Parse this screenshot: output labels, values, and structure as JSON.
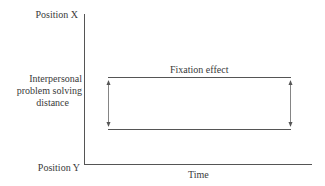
{
  "diagram": {
    "y_axis": {
      "top_label": "Position X",
      "bottom_label": "Position Y",
      "title_lines": [
        "Interpersonal",
        "problem solving",
        "distance"
      ]
    },
    "x_axis": {
      "label": "Time"
    },
    "band": {
      "label": "Fixation effect"
    },
    "colors": {
      "line": "#555555",
      "text": "#3a3a3a",
      "background": "#ffffff"
    }
  }
}
